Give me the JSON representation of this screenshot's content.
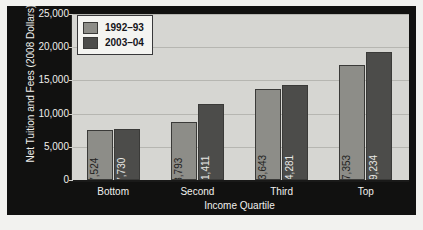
{
  "chart_data": {
    "type": "bar",
    "title": "",
    "subtitle": "",
    "xlabel": "Income Quartile",
    "ylabel": "Net Tuition and Fees (2008 Dollars)",
    "categories": [
      "Bottom",
      "Second",
      "Third",
      "Top"
    ],
    "series": [
      {
        "name": "1992–93",
        "color": "#8d8d88",
        "values": [
          7524,
          8793,
          13643,
          17353
        ],
        "value_labels": [
          "$7,524",
          "$8,793",
          "$13,643",
          "$17,353"
        ]
      },
      {
        "name": "2003–04",
        "color": "#4c4c4a",
        "values": [
          7730,
          11411,
          14281,
          19234
        ],
        "value_labels": [
          "$7,730",
          "$11,411",
          "$14,281",
          "$19,234"
        ]
      }
    ],
    "ylim": [
      0,
      25000
    ],
    "ytick_values": [
      0,
      5000,
      10000,
      15000,
      20000,
      25000
    ],
    "ytick_labels": [
      "0",
      "5,000",
      "10,000",
      "15,000",
      "20,000",
      "25,000"
    ],
    "grid": true,
    "legend_position": "top-left",
    "plot_background": "#d6d6d2",
    "figure_background": "#111110"
  }
}
